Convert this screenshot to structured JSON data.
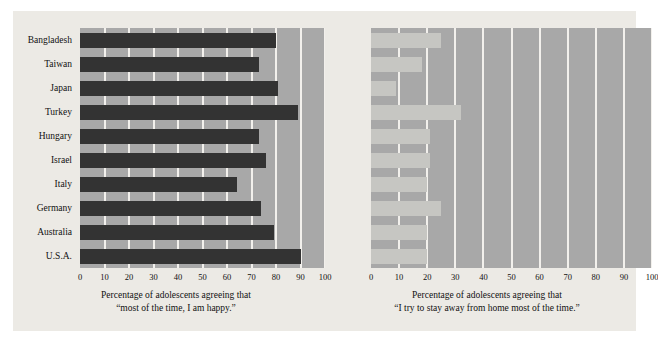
{
  "figure": {
    "background_color": "#ffffff",
    "panel_color": "#eceae5",
    "plot_background_color": "#a8a8a8",
    "gridline_color": "#f2f0ec"
  },
  "chart_data": [
    {
      "id": "happy",
      "type": "bar",
      "orientation": "horizontal",
      "title": "",
      "xlabel_line1": "Percentage of adolescents agreeing that",
      "xlabel_line2": "“most of the time, I am happy.”",
      "ylabel": "",
      "xlim": [
        0,
        100
      ],
      "xticks": [
        0,
        10,
        20,
        30,
        40,
        50,
        60,
        70,
        80,
        90,
        100
      ],
      "xtick_labels": [
        "0",
        "10",
        "20",
        "30",
        "40",
        "50",
        "60",
        "70",
        "80",
        "90",
        "100"
      ],
      "grid": true,
      "grid_axis": "x",
      "legend": "none",
      "bar_color": "#333333",
      "categories": [
        "Bangladesh",
        "Taiwan",
        "Japan",
        "Turkey",
        "Hungary",
        "Israel",
        "Italy",
        "Germany",
        "Australia",
        "U.S.A."
      ],
      "values": [
        80,
        73,
        81,
        89,
        73,
        76,
        64,
        74,
        79,
        90
      ]
    },
    {
      "id": "away-from-home",
      "type": "bar",
      "orientation": "horizontal",
      "title": "",
      "xlabel_line1": "Percentage of adolescents agreeing that",
      "xlabel_line2": "“I try to stay away from home most of the time.”",
      "ylabel": "",
      "xlim": [
        0,
        100
      ],
      "xticks": [
        0,
        10,
        20,
        30,
        40,
        50,
        60,
        70,
        80,
        90,
        100
      ],
      "xtick_labels": [
        "0",
        "10",
        "20",
        "30",
        "40",
        "50",
        "60",
        "70",
        "80",
        "90",
        "100"
      ],
      "grid": true,
      "grid_axis": "x",
      "legend": "none",
      "bar_color": "#c6c6c2",
      "categories": [
        "Bangladesh",
        "Taiwan",
        "Japan",
        "Turkey",
        "Hungary",
        "Israel",
        "Italy",
        "Germany",
        "Australia",
        "U.S.A."
      ],
      "values": [
        25,
        18,
        9,
        32,
        21,
        21,
        20,
        25,
        20,
        20
      ]
    }
  ]
}
